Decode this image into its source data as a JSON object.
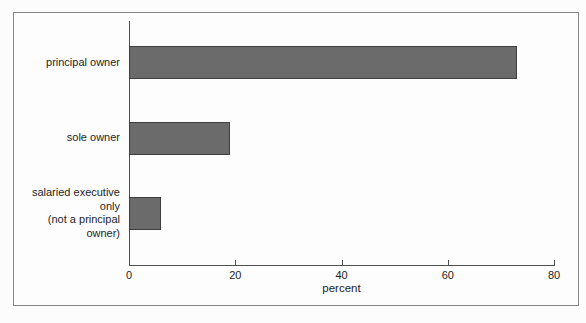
{
  "chart_data": {
    "type": "bar",
    "orientation": "horizontal",
    "title": "",
    "categories": [
      "principal owner",
      "sole owner",
      "salaried executive only\n(not a principal owner)"
    ],
    "values": [
      73,
      19,
      6
    ],
    "xlabel": "percent",
    "xlim": [
      0,
      80
    ],
    "xticks": [
      0,
      20,
      40,
      60,
      80
    ],
    "grid": false,
    "legend": false,
    "colors": {
      "bar_fill": "#6b6b6b",
      "bar_border": "#3f3f3f",
      "axis": "#4f4f4f",
      "text": "#1e1e1e",
      "frame_border": "#848484",
      "background": "#fdfdfd"
    }
  }
}
